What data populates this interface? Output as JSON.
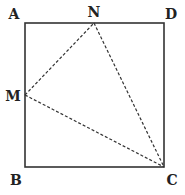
{
  "diagram": {
    "type": "geometry",
    "colors": {
      "background": "#ffffff",
      "stroke": "#333333",
      "label": "#222222"
    },
    "square": {
      "vertices": [
        "A",
        "B",
        "C",
        "D"
      ],
      "style": "solid"
    },
    "triangle": {
      "vertices": [
        "M",
        "N",
        "C"
      ],
      "style": "dashed"
    },
    "points": {
      "A": {
        "label": "A",
        "x": 25,
        "y": 23,
        "label_x": 14,
        "label_y": 14
      },
      "B": {
        "label": "B",
        "x": 25,
        "y": 167,
        "label_x": 16,
        "label_y": 180
      },
      "C": {
        "label": "C",
        "x": 164,
        "y": 167,
        "label_x": 172,
        "label_y": 180
      },
      "D": {
        "label": "D",
        "x": 164,
        "y": 23,
        "label_x": 171,
        "label_y": 14
      },
      "M": {
        "label": "M",
        "x": 25,
        "y": 95,
        "label_x": 13,
        "label_y": 96
      },
      "N": {
        "label": "N",
        "x": 94,
        "y": 23,
        "label_x": 94,
        "label_y": 12
      }
    },
    "segments": [
      {
        "from": "A",
        "to": "D",
        "style": "solid"
      },
      {
        "from": "D",
        "to": "C",
        "style": "solid"
      },
      {
        "from": "C",
        "to": "B",
        "style": "solid"
      },
      {
        "from": "B",
        "to": "A",
        "style": "solid"
      },
      {
        "from": "M",
        "to": "N",
        "style": "dashed"
      },
      {
        "from": "N",
        "to": "C",
        "style": "dashed"
      },
      {
        "from": "M",
        "to": "C",
        "style": "dashed"
      }
    ]
  }
}
